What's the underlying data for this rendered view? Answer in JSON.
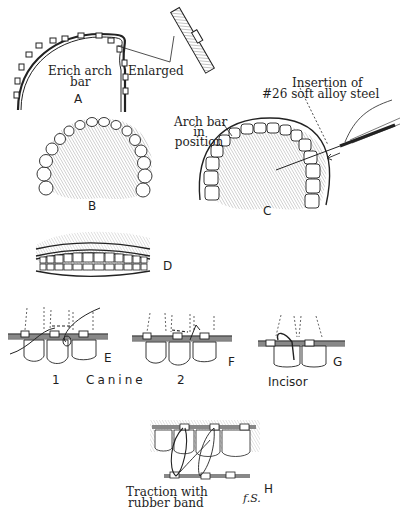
{
  "figure": {
    "panels": {
      "A": {
        "letter": "A",
        "label_arch_bar_line1": "Erich arch",
        "label_arch_bar_line2": "bar",
        "label_enlarged": "Enlarged"
      },
      "B": {
        "letter": "B"
      },
      "C": {
        "letter": "C",
        "label_arch_bar_line1": "Arch bar",
        "label_arch_bar_line2": "in",
        "label_arch_bar_line3": "position",
        "label_insertion_line1": "Insertion of",
        "label_insertion_line2": "#26 soft alloy steel"
      },
      "D": {
        "letter": "D"
      },
      "E": {
        "letter": "E",
        "number": "1"
      },
      "F": {
        "letter": "F",
        "number": "2"
      },
      "G": {
        "letter": "G"
      },
      "H": {
        "letter": "H",
        "label_line1": "Traction with",
        "label_line2": "rubber band",
        "signature": "f.S."
      }
    },
    "group_labels": {
      "canine": "Canine",
      "incisor": "Incisor"
    }
  }
}
